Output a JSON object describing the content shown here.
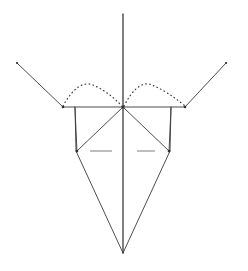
{
  "figure": {
    "background_color": "#ffffff",
    "line_color": "#3a3a3a",
    "mast_color": "#555555",
    "dotted_color": "#3f3f3f",
    "dash_mark_color": "#8a8a8a",
    "canvas": {
      "width": 248,
      "height": 271
    }
  },
  "geometry": {
    "center_x": 123,
    "mast": {
      "x": 123,
      "y_top": 14,
      "y_bottom": 253
    },
    "spar": {
      "y": 107,
      "x_left": 63,
      "x_right": 185
    },
    "left_wing": {
      "x1": 17,
      "y1": 63,
      "x2": 63,
      "y2": 107
    },
    "right_wing": {
      "x1": 226,
      "y1": 63,
      "x2": 185,
      "y2": 107
    },
    "left_strut": {
      "x": 75,
      "y_top": 107,
      "y_bottom": 151
    },
    "right_strut": {
      "x": 171,
      "y_top": 107,
      "y_bottom": 151
    },
    "left_node": {
      "x": 77,
      "y": 151
    },
    "right_node": {
      "x": 169,
      "y": 151
    },
    "apex": {
      "x": 123,
      "y": 253
    },
    "left_diagonal": {
      "x1": 123,
      "y1": 107,
      "x2": 77,
      "y2": 151
    },
    "right_diagonal": {
      "x1": 123,
      "y1": 107,
      "x2": 169,
      "y2": 151
    },
    "left_arc": {
      "x_start": 63,
      "x_end": 122,
      "peak_x": 93,
      "peak_y": 85
    },
    "right_arc": {
      "x_start": 124,
      "x_end": 185,
      "peak_x": 152,
      "peak_y": 85
    },
    "left_dash_mark": {
      "x1": 90,
      "x2": 112,
      "y": 151
    },
    "right_dash_mark": {
      "x1": 137,
      "x2": 155,
      "y": 151
    }
  },
  "labels": {
    "mast": "vertical mast",
    "spar": "horizontal spar",
    "left_wing": "left wing arm",
    "right_wing": "right wing arm",
    "left_arc": "left dotted arc",
    "right_arc": "right dotted arc",
    "left_strut": "left vertical strut",
    "right_strut": "right vertical strut",
    "left_diagonal": "left diagonal brace",
    "right_diagonal": "right diagonal brace",
    "lower_left_edge": "lower left edge",
    "lower_right_edge": "lower right edge",
    "inner_left_edge": "inner left edge",
    "inner_right_edge": "inner right edge",
    "left_dash_mark": "left dash marker",
    "right_dash_mark": "right dash marker",
    "apex": "bottom apex"
  }
}
